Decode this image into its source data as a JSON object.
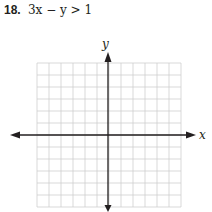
{
  "problem": {
    "number": "18.",
    "inequality": "3x − y > 1"
  },
  "graph": {
    "x_axis_label": "x",
    "y_axis_label": "y",
    "grid": {
      "columns": 12,
      "rows": 12,
      "left": 37,
      "top": 63,
      "cell": 12
    },
    "origin": {
      "x": 108,
      "y": 135
    },
    "grid_color": "#cfcfcf",
    "axis_color": "#231f20"
  }
}
